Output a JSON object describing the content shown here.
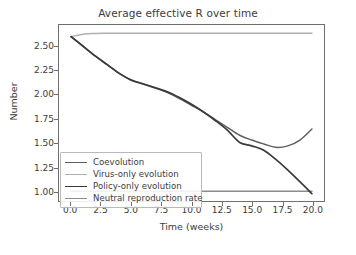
{
  "chart_data": {
    "type": "line",
    "title": "Average effective R over time",
    "xlabel": "Time (weeks)",
    "ylabel": "Number",
    "xlim": [
      -1.0,
      21.0
    ],
    "ylim": [
      0.9,
      2.72
    ],
    "grid": false,
    "legend_position": "lower left",
    "xticks": [
      "0.0",
      "2.5",
      "5.0",
      "7.5",
      "10.0",
      "12.5",
      "15.0",
      "17.5",
      "20.0"
    ],
    "xtick_values": [
      0.0,
      2.5,
      5.0,
      7.5,
      10.0,
      12.5,
      15.0,
      17.5,
      20.0
    ],
    "yticks": [
      "1.00",
      "1.25",
      "1.50",
      "1.75",
      "2.00",
      "2.25",
      "2.50"
    ],
    "ytick_values": [
      1.0,
      1.25,
      1.5,
      1.75,
      2.0,
      2.25,
      2.5
    ],
    "x": [
      0,
      1,
      2,
      3,
      4,
      5,
      6,
      7,
      8,
      9,
      10,
      11,
      12,
      13,
      14,
      15,
      16,
      17,
      18,
      19,
      20
    ],
    "series": [
      {
        "name": "Coevolution",
        "color": "#5f5f5f",
        "width": 1.5,
        "values": [
          2.6,
          2.5,
          2.4,
          2.31,
          2.22,
          2.15,
          2.11,
          2.07,
          2.02,
          1.96,
          1.89,
          1.82,
          1.74,
          1.66,
          1.58,
          1.53,
          1.49,
          1.455,
          1.47,
          1.53,
          1.645
        ]
      },
      {
        "name": "Virus-only evolution",
        "color": "#b0b0b0",
        "width": 1.5,
        "values": [
          2.6,
          2.625,
          2.632,
          2.634,
          2.635,
          2.635,
          2.635,
          2.635,
          2.635,
          2.635,
          2.635,
          2.635,
          2.635,
          2.635,
          2.635,
          2.635,
          2.635,
          2.635,
          2.635,
          2.635,
          2.635
        ]
      },
      {
        "name": "Policy-only evolution",
        "color": "#3a3a3a",
        "width": 1.7,
        "values": [
          2.6,
          2.5,
          2.4,
          2.31,
          2.22,
          2.15,
          2.11,
          2.07,
          2.03,
          1.97,
          1.9,
          1.82,
          1.73,
          1.63,
          1.505,
          1.47,
          1.425,
          1.33,
          1.22,
          1.1,
          0.975
        ]
      },
      {
        "name": "Neutral reproduction rate",
        "color": "#8c8c8c",
        "width": 1.5,
        "values": [
          1.0,
          1.0,
          1.0,
          1.0,
          1.0,
          1.0,
          1.0,
          1.0,
          1.0,
          1.0,
          1.0,
          1.0,
          1.0,
          1.0,
          1.0,
          1.0,
          1.0,
          1.0,
          1.0,
          1.0,
          1.0
        ]
      }
    ]
  },
  "legend": {
    "entries": [
      {
        "label": "Coevolution"
      },
      {
        "label": "Virus-only evolution"
      },
      {
        "label": "Policy-only evolution"
      },
      {
        "label": "Neutral reproduction rate"
      }
    ]
  }
}
